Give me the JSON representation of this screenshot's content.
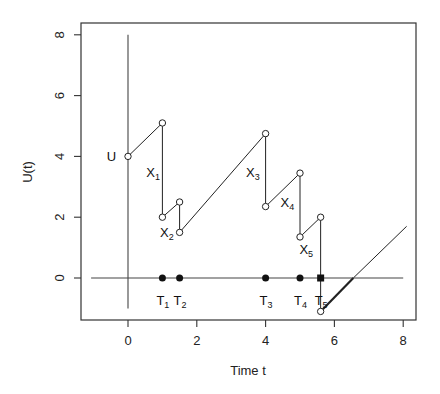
{
  "chart_data": {
    "type": "line",
    "title": "",
    "xlabel": "Time t",
    "ylabel": "U(t)",
    "xlim": [
      -1.4,
      8.3
    ],
    "ylim": [
      -1.4,
      8.4
    ],
    "x_ticks": [
      0,
      2,
      4,
      6,
      8
    ],
    "y_ticks": [
      0,
      2,
      4,
      6,
      8
    ],
    "grid": false,
    "legend": null,
    "series": [
      {
        "name": "surplus path",
        "points": [
          [
            0,
            4.0
          ],
          [
            1.0,
            5.1
          ],
          [
            1.0,
            2.0
          ],
          [
            1.5,
            2.5
          ],
          [
            1.5,
            1.5
          ],
          [
            4.0,
            4.75
          ],
          [
            4.0,
            2.35
          ],
          [
            5.0,
            3.45
          ],
          [
            5.0,
            1.35
          ],
          [
            5.6,
            2.0
          ],
          [
            5.6,
            -1.1
          ]
        ]
      },
      {
        "name": "post-ruin continuation (bold)",
        "points": [
          [
            5.6,
            -1.1
          ],
          [
            6.55,
            0
          ]
        ]
      },
      {
        "name": "post-ruin continuation (thin)",
        "points": [
          [
            6.55,
            0
          ],
          [
            8.1,
            1.7
          ]
        ]
      }
    ],
    "open_circles": [
      [
        0,
        4.0
      ],
      [
        1.0,
        5.1
      ],
      [
        1.0,
        2.0
      ],
      [
        1.5,
        2.5
      ],
      [
        1.5,
        1.5
      ],
      [
        4.0,
        4.75
      ],
      [
        4.0,
        2.35
      ],
      [
        5.0,
        3.45
      ],
      [
        5.0,
        1.35
      ],
      [
        5.6,
        2.0
      ],
      [
        5.6,
        -1.1
      ]
    ],
    "event_times": [
      {
        "label": "T",
        "sub": "1",
        "t": 1.0,
        "marker": "dot"
      },
      {
        "label": "T",
        "sub": "2",
        "t": 1.5,
        "marker": "dot"
      },
      {
        "label": "T",
        "sub": "3",
        "t": 4.0,
        "marker": "dot"
      },
      {
        "label": "T",
        "sub": "4",
        "t": 5.0,
        "marker": "dot"
      },
      {
        "label": "T",
        "sub": "5",
        "t": 5.6,
        "marker": "square"
      }
    ],
    "annotations": [
      {
        "text": "U",
        "sub": "",
        "x": -0.5,
        "y": 4.0
      },
      {
        "text": "X",
        "sub": "1",
        "x": 0.65,
        "y": 3.5
      },
      {
        "text": "X",
        "sub": "2",
        "x": 1.05,
        "y": 1.5
      },
      {
        "text": "X",
        "sub": "3",
        "x": 3.55,
        "y": 3.5
      },
      {
        "text": "X",
        "sub": "4",
        "x": 4.55,
        "y": 2.5
      },
      {
        "text": "X",
        "sub": "5",
        "x": 5.1,
        "y": 0.95
      }
    ],
    "reference_lines": [
      {
        "type": "horizontal",
        "y": 0,
        "from": -1.0,
        "to": 8.0
      },
      {
        "type": "vertical",
        "x": 0,
        "from": -1.0,
        "to": 8.0
      }
    ]
  }
}
